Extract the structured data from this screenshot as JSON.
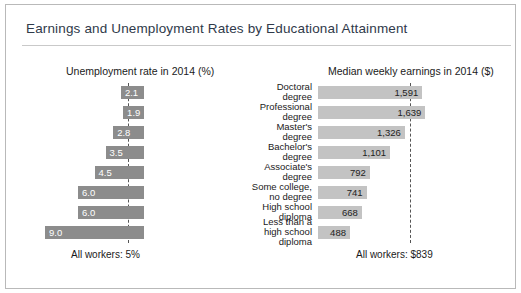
{
  "title": "Earnings and Unemployment Rates by Educational Attainment",
  "headers": {
    "left": "Unemployment rate in 2014 (%)",
    "right": "Median weekly earnings in 2014 ($)"
  },
  "footnotes": {
    "left": "All workers: 5%",
    "right": "All workers: $839"
  },
  "chart_data": {
    "type": "bar",
    "title": "Earnings and Unemployment Rates by Educational Attainment",
    "orientation": "horizontal",
    "categories": [
      "Doctoral degree",
      "Professional degree",
      "Master's degree",
      "Bachelor's degree",
      "Associate's degree",
      "Some college, no degree",
      "High school diploma",
      "Less than a high school diploma"
    ],
    "category_lines": [
      [
        "Doctoral",
        "degree"
      ],
      [
        "Professional",
        "degree"
      ],
      [
        "Master's",
        "degree"
      ],
      [
        "Bachelor's",
        "degree"
      ],
      [
        "Associate's",
        "degree"
      ],
      [
        "Some college,",
        "no degree"
      ],
      [
        "High school",
        "diploma"
      ],
      [
        "Less than a",
        "high school",
        "diploma"
      ]
    ],
    "series": [
      {
        "name": "Unemployment rate in 2014 (%)",
        "side": "left",
        "xlabel": "Unemployment rate in 2014 (%)",
        "values": [
          2.1,
          1.9,
          2.8,
          3.5,
          4.5,
          6.0,
          6.0,
          9.0
        ],
        "labels": [
          "2.1",
          "1.9",
          "2.8",
          "3.5",
          "4.5",
          "6.0",
          "6.0",
          "9.0"
        ],
        "reference_line": {
          "label": "All workers: 5%",
          "value": 5.0
        },
        "xlim": [
          0,
          10
        ],
        "color": "#8c8c8c"
      },
      {
        "name": "Median weekly earnings in 2014 ($)",
        "side": "right",
        "xlabel": "Median weekly earnings in 2014 ($)",
        "values": [
          1591,
          1639,
          1326,
          1101,
          792,
          741,
          668,
          488
        ],
        "labels": [
          "1,591",
          "1,639",
          "1,326",
          "1,101",
          "792",
          "741",
          "668",
          "488"
        ],
        "reference_line": {
          "label": "All workers: $839",
          "value": 839
        },
        "xlim": [
          0,
          1800
        ],
        "color": "#c3c3c3"
      }
    ],
    "grid": false,
    "legend": "none"
  }
}
